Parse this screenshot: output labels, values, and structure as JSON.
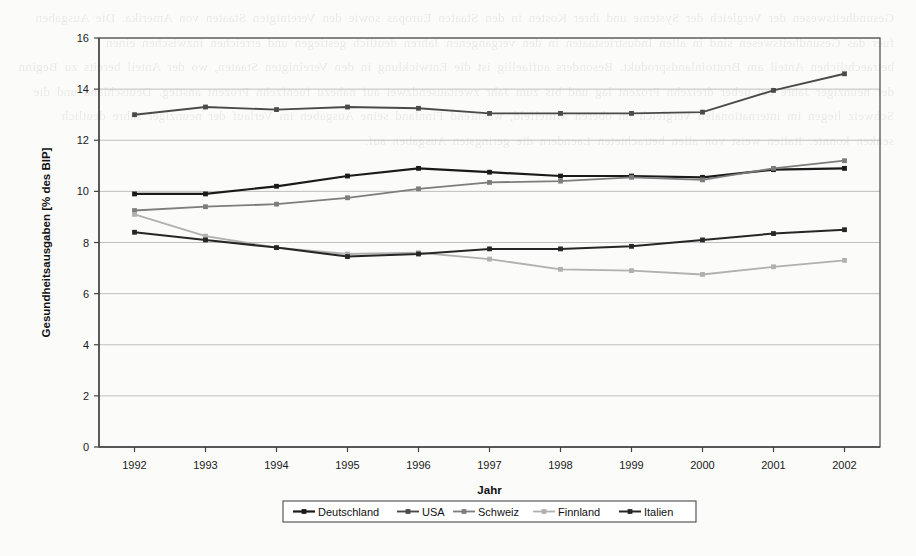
{
  "background_text": "Gesundheitswesen der Vergleich der Systeme und ihrer Kosten in den Staaten Europas sowie den Vereinigten Staaten von Amerika. Die Ausgaben fuer das Gesundheitswesen sind in allen Industriestaaten in den vergangenen Jahren deutlich gestiegen und erreichen inzwischen einen betraechtlichen Anteil am Bruttoinlandsprodukt. Besonders auffaellig ist die Entwicklung in den Vereinigten Staaten, wo der Anteil bereits zu Beginn der neunziger Jahre bei ueber dreizehn Prozent lag und bis zum Jahr zweitausendzwei auf nahezu fuenfzehn Prozent anstieg. Deutschland und die Schweiz liegen im internationalen Vergleich im oberen Mittelfeld, waehrend Finnland seine Ausgaben im Verlauf der neunziger Jahre deutlich senken konnte. Italien weist von allen betrachteten Laendern die geringsten Ausgaben auf.",
  "chart_data": {
    "type": "line",
    "title": "",
    "xlabel": "Jahr",
    "ylabel": "Gesundheitsausgaben [% des BIP]",
    "x": [
      1992,
      1993,
      1994,
      1995,
      1996,
      1997,
      1998,
      1999,
      2000,
      2001,
      2002
    ],
    "xtick_labels": [
      "1992",
      "1993",
      "1994",
      "1995",
      "1996",
      "1997",
      "1998",
      "1999",
      "2000",
      "2001",
      "2002"
    ],
    "ytick_labels": [
      "0",
      "2",
      "4",
      "6",
      "8",
      "10",
      "12",
      "14",
      "16"
    ],
    "yticks": [
      0,
      2,
      4,
      6,
      8,
      10,
      12,
      14,
      16
    ],
    "ylim": [
      0,
      16
    ],
    "grid": "horizontal",
    "legend_position": "bottom-center",
    "series": [
      {
        "name": "Deutschland",
        "color": "#1a1a1a",
        "width": 2.2,
        "marker": "square",
        "values": [
          9.9,
          9.9,
          10.2,
          10.6,
          10.9,
          10.75,
          10.6,
          10.6,
          10.55,
          10.85,
          10.9
        ]
      },
      {
        "name": "USA",
        "color": "#4a4a4a",
        "width": 1.9,
        "marker": "square",
        "values": [
          13.0,
          13.3,
          13.2,
          13.3,
          13.25,
          13.05,
          13.05,
          13.05,
          13.1,
          13.95,
          14.6
        ]
      },
      {
        "name": "Schweiz",
        "color": "#7d7d7d",
        "width": 1.8,
        "marker": "square",
        "values": [
          9.25,
          9.4,
          9.5,
          9.75,
          10.1,
          10.35,
          10.4,
          10.55,
          10.45,
          10.9,
          11.2
        ]
      },
      {
        "name": "Finnland",
        "color": "#b0b0b0",
        "width": 1.8,
        "marker": "square",
        "values": [
          9.1,
          8.25,
          7.8,
          7.55,
          7.6,
          7.35,
          6.95,
          6.9,
          6.75,
          7.05,
          7.3
        ]
      },
      {
        "name": "Italien",
        "color": "#262626",
        "width": 2.0,
        "marker": "square",
        "values": [
          8.4,
          8.1,
          7.8,
          7.45,
          7.55,
          7.75,
          7.75,
          7.85,
          8.1,
          8.35,
          8.5
        ]
      }
    ]
  }
}
